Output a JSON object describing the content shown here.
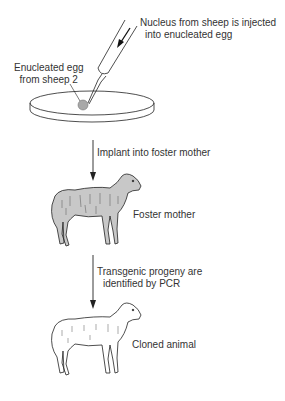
{
  "diagram": {
    "step1": {
      "injection_label_line1": "Nucleus from sheep is injected",
      "injection_label_line2": "into enucleated egg",
      "egg_label_line1": "Enucleated egg",
      "egg_label_line2": "from sheep 2"
    },
    "step2": {
      "arrow_label": "Implant into foster mother",
      "animal_label": "Foster mother"
    },
    "step3": {
      "arrow_label_line1": "Transgenic progeny are",
      "arrow_label_line2": "identified by PCR",
      "animal_label": "Cloned animal"
    },
    "colors": {
      "line": "#222222",
      "foster_fill": "#c8c8c8",
      "clone_fill": "#ffffff",
      "egg_fill": "#a8a8a8"
    }
  }
}
